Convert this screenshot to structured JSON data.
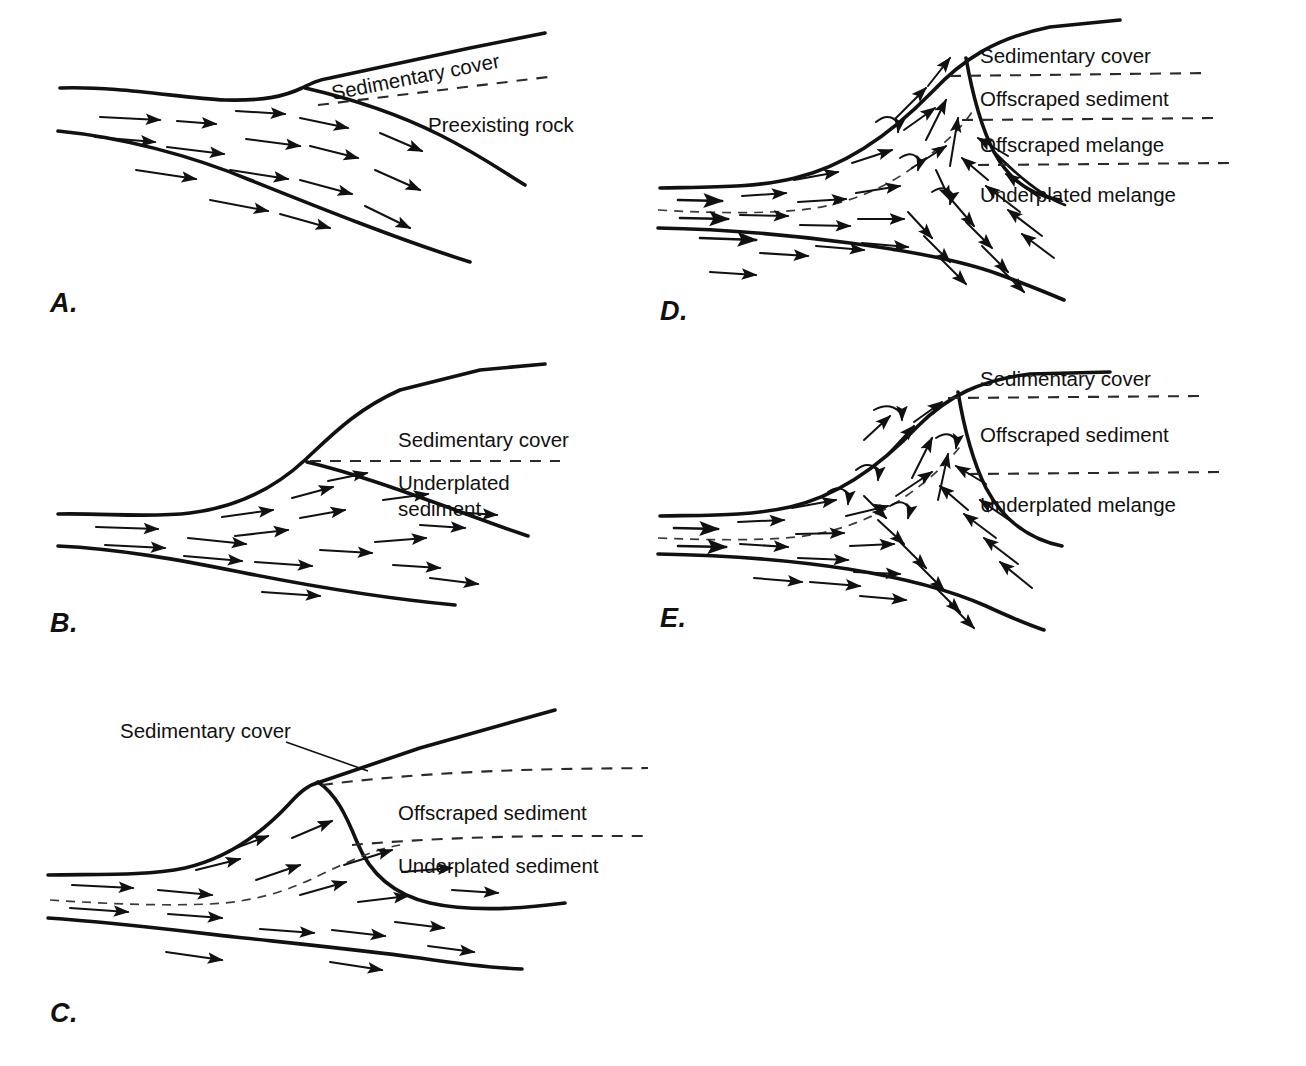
{
  "figure": {
    "kind": "geologic-cross-section-series",
    "panel_letters": [
      "A.",
      "B.",
      "C.",
      "D.",
      "E."
    ],
    "caption_cut_off": ""
  },
  "panels": [
    {
      "id": "A",
      "letter": "A.",
      "labels": [
        {
          "name": "sedimentary-cover",
          "text": "Sedimentary cover",
          "rotated": true
        },
        {
          "name": "preexisting-rock",
          "text": "Preexisting rock",
          "rotated": false
        }
      ]
    },
    {
      "id": "B",
      "letter": "B.",
      "labels": [
        {
          "name": "sedimentary-cover",
          "text": "Sedimentary cover",
          "rotated": false
        },
        {
          "name": "underplated-sediment-line1",
          "text": "Underplated",
          "rotated": false
        },
        {
          "name": "underplated-sediment-line2",
          "text": "sediment",
          "rotated": false
        }
      ]
    },
    {
      "id": "C",
      "letter": "C.",
      "labels": [
        {
          "name": "sedimentary-cover",
          "text": "Sedimentary cover",
          "rotated": false
        },
        {
          "name": "offscraped-sediment",
          "text": "Offscraped sediment",
          "rotated": false
        },
        {
          "name": "underplated-sediment",
          "text": "Underplated sediment",
          "rotated": false
        }
      ]
    },
    {
      "id": "D",
      "letter": "D.",
      "labels": [
        {
          "name": "sedimentary-cover",
          "text": "Sedimentary cover",
          "rotated": false
        },
        {
          "name": "offscraped-sediment",
          "text": "Offscraped sediment",
          "rotated": false
        },
        {
          "name": "offscraped-melange",
          "text": "Offscraped melange",
          "rotated": false
        },
        {
          "name": "underplated-melange",
          "text": "Underplated melange",
          "rotated": false
        }
      ]
    },
    {
      "id": "E",
      "letter": "E.",
      "labels": [
        {
          "name": "sedimentary-cover",
          "text": "Sedimentary cover",
          "rotated": false
        },
        {
          "name": "offscraped-sediment",
          "text": "Offscraped sediment",
          "rotated": false
        },
        {
          "name": "underplated-melange",
          "text": "Underplated melange",
          "rotated": false
        }
      ]
    }
  ],
  "style": {
    "background": "#ffffff",
    "line_color": "#111111",
    "dash_color": "#2a2a2a",
    "text_color": "#111111"
  }
}
